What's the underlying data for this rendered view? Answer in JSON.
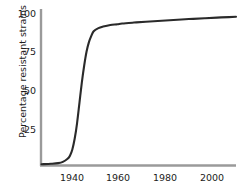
{
  "chart_data": {
    "type": "line",
    "title": "",
    "xlabel": "",
    "ylabel": "Percentage resistant strains",
    "xlim": [
      1926,
      2008
    ],
    "ylim": [
      0,
      100
    ],
    "grid": false,
    "legend": null,
    "xticks": [
      1940,
      1960,
      1980,
      2000
    ],
    "xticklabels": [
      "1940",
      "1960",
      "1980",
      "2000"
    ],
    "yticks": [
      25,
      50,
      75,
      100
    ],
    "yticklabels": [
      "25",
      "50",
      "75",
      "100"
    ],
    "series": [
      {
        "name": "Percentage resistant strains",
        "color": "#2a2a2a",
        "x": [
          1926,
          1930,
          1933,
          1935,
          1937,
          1938,
          1939,
          1940,
          1941,
          1942,
          1943,
          1944,
          1945,
          1946,
          1947,
          1948,
          1950,
          1952,
          1955,
          1958,
          1960,
          1965,
          1970,
          1975,
          1980,
          1985,
          1990,
          1995,
          2000,
          2005,
          2008
        ],
        "y": [
          0.5,
          0.8,
          1.2,
          2,
          4,
          6,
          10,
          17,
          27,
          40,
          53,
          64,
          73,
          79,
          83,
          86,
          88,
          89,
          90,
          90.5,
          91,
          91.6,
          92.1,
          92.6,
          93.1,
          93.6,
          94,
          94.4,
          94.8,
          95.1,
          95.3
        ]
      }
    ]
  },
  "axes": {
    "axis_color": "#9a9a9a",
    "tick_text_color": "#1c1c1c"
  }
}
